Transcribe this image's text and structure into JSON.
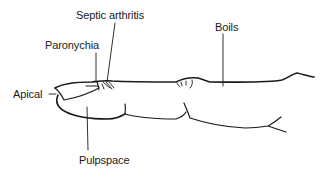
{
  "diagram": {
    "colors": {
      "ink": "#1a1a1a",
      "background": "#ffffff"
    },
    "labels": [
      {
        "id": "septic-arthritis",
        "text": "Septic arthritis"
      },
      {
        "id": "paronychia",
        "text": "Paronychia"
      },
      {
        "id": "boils",
        "text": "Boils"
      },
      {
        "id": "apical",
        "text": "Apical"
      },
      {
        "id": "pulpspace",
        "text": "Pulpspace"
      }
    ]
  }
}
